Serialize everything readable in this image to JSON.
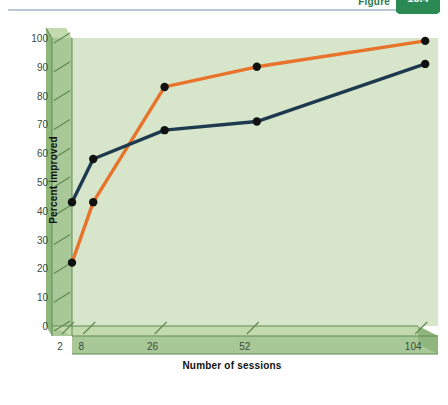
{
  "banner": {
    "figure_word": "Figure",
    "figure_number": "13.4"
  },
  "chart_data": {
    "type": "line",
    "title": "",
    "xlabel": "Number of sessions",
    "ylabel": "Percent improved",
    "categories": [
      "2",
      "8",
      "26",
      "52",
      "104"
    ],
    "x_tick_labels": [
      "2",
      "8",
      "26",
      "52",
      "104"
    ],
    "y_tick_labels": [
      "0",
      "10",
      "20",
      "30",
      "40",
      "50",
      "60",
      "70",
      "80",
      "90",
      "100"
    ],
    "ylim": [
      0,
      100
    ],
    "y_tick_step": 10,
    "grid": false,
    "legend": "none",
    "series": [
      {
        "name": "orange-series",
        "color": "#e8732a",
        "marker_color": "#111111",
        "values": [
          22,
          43,
          83,
          90,
          99
        ]
      },
      {
        "name": "navy-series",
        "color": "#1d3a4f",
        "marker_color": "#111111",
        "values": [
          43,
          58,
          68,
          71,
          91
        ]
      }
    ]
  },
  "colors": {
    "plot_background": "#d7e5cb",
    "axis_face": "#a8c897",
    "axis_face_dark": "#8fb67d",
    "axis_top": "#c3daae",
    "axis_edge": "#5f8a52",
    "orange": "#e8732a",
    "navy": "#1d3a4f",
    "marker": "#111111",
    "badge_green": "#2b8a53"
  }
}
